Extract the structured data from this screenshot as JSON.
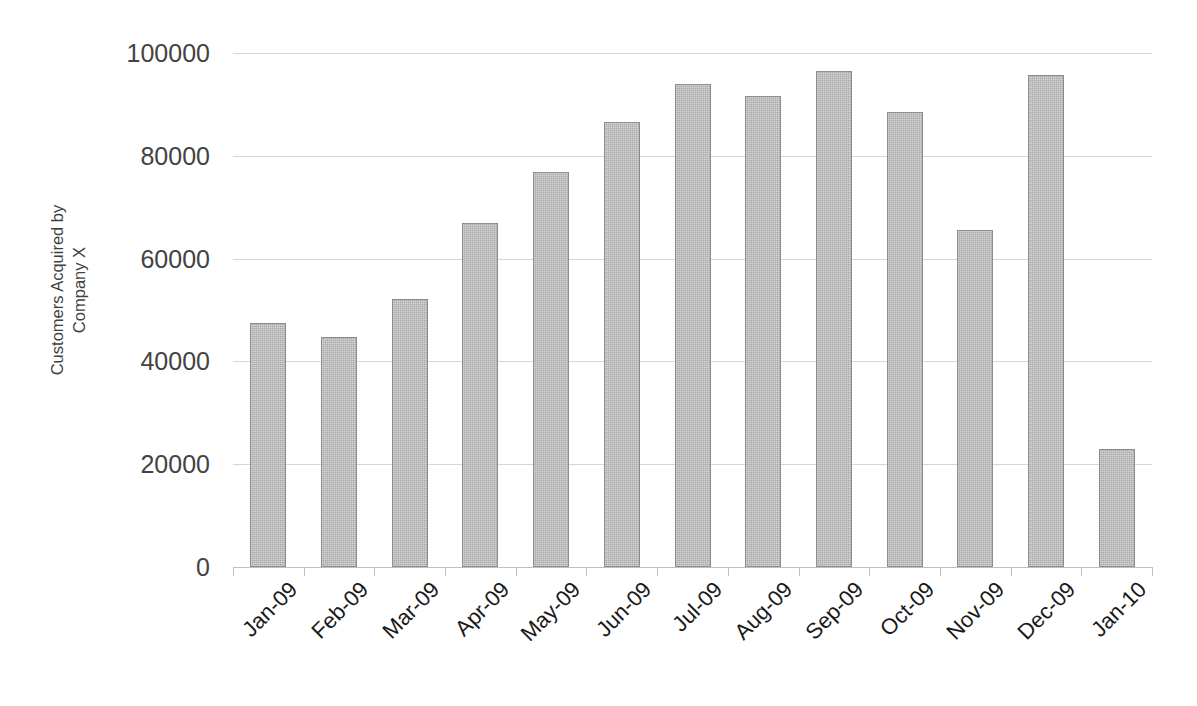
{
  "chart_data": {
    "type": "bar",
    "title": "",
    "subtitle": "",
    "xlabel": "",
    "ylabel": "Customers Acquired by Company X",
    "ylabel_lines": [
      "Customers Acquired by",
      "Company X"
    ],
    "categories": [
      "Jan-09",
      "Feb-09",
      "Mar-09",
      "Apr-09",
      "May-09",
      "Jun-09",
      "Jul-09",
      "Aug-09",
      "Sep-09",
      "Oct-09",
      "Nov-09",
      "Dec-09",
      "Jan-10"
    ],
    "values": [
      47500,
      44700,
      52100,
      66900,
      76800,
      86500,
      94000,
      91600,
      96500,
      88500,
      65500,
      95700,
      23000
    ],
    "ylim": [
      0,
      100000
    ],
    "yticks": [
      0,
      20000,
      40000,
      60000,
      80000,
      100000
    ],
    "ytick_labels": [
      "0",
      "20000",
      "40000",
      "60000",
      "80000",
      "100000"
    ],
    "grid": true,
    "grid_axis": "y",
    "legend": false,
    "legend_position": "none",
    "series": [
      {
        "name": "Customers Acquired by Company X",
        "values": [
          47500,
          44700,
          52100,
          66900,
          76800,
          86500,
          94000,
          91600,
          96500,
          88500,
          65500,
          95700,
          23000
        ]
      }
    ],
    "colors": {
      "bar_fill": "#a9a9a9",
      "bar_border": "#8d8d8d",
      "gridline": "#d6d6d6",
      "axis_line": "#c0c0c0",
      "tick_label": "#434343",
      "axis_title": "#3f3f3f",
      "background": "#ffffff"
    }
  }
}
